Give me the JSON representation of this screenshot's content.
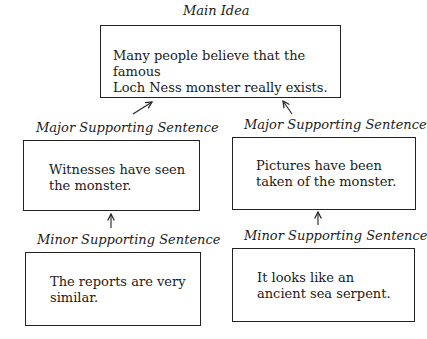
{
  "main_idea": {
    "label": "Main Idea",
    "text": "Many people believe that the famous\nLoch Ness monster really exists."
  },
  "left_branch": {
    "major": {
      "label": "Major Supporting Sentence",
      "text": "Witnesses have seen\nthe monster."
    },
    "minor": {
      "label": "Minor Supporting Sentence",
      "text": "The reports are very\nsimilar."
    }
  },
  "right_branch": {
    "major": {
      "label": "Major Supporting Sentence",
      "text": "Pictures have been\ntaken of the monster."
    },
    "minor": {
      "label": "Minor Supporting Sentence",
      "text": "It looks like an\nancient sea serpent."
    }
  },
  "arrows": [
    {
      "from": "left-major",
      "to": "main-idea",
      "direction": "up-right"
    },
    {
      "from": "right-major",
      "to": "main-idea",
      "direction": "up-left"
    },
    {
      "from": "left-minor",
      "to": "left-major",
      "direction": "up"
    },
    {
      "from": "right-minor",
      "to": "right-major",
      "direction": "up"
    }
  ]
}
